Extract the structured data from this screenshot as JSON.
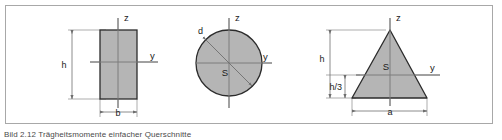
{
  "figure": {
    "caption": "Bild 2.12 Trägheitsmomente einfacher Querschnitte",
    "frame_color": "#a8a8a8",
    "fill_color": "#b5b5b5",
    "outline_color": "#2b2b2b",
    "axis_color": "#8a8a8a",
    "dim_color": "#6e6e6e",
    "background": "#ffffff"
  },
  "shapes": [
    {
      "id": "rectangle",
      "name": "rectangle-cross-section",
      "axis_z": "z",
      "axis_y": "y",
      "dims": [
        {
          "key": "height",
          "label": "h"
        },
        {
          "key": "width",
          "label": "b"
        }
      ]
    },
    {
      "id": "circle",
      "name": "circle-cross-section",
      "axis_z": "z",
      "axis_y": "y",
      "centroid": "S",
      "dims": [
        {
          "key": "diameter",
          "label": "d"
        }
      ]
    },
    {
      "id": "triangle",
      "name": "triangle-cross-section",
      "axis_z": "z",
      "axis_y": "y",
      "centroid": "S",
      "dims": [
        {
          "key": "height",
          "label": "h"
        },
        {
          "key": "centroid_height",
          "label": "h/3"
        },
        {
          "key": "base",
          "label": "a"
        }
      ]
    }
  ],
  "labels": {
    "rect_z": "z",
    "rect_y": "y",
    "rect_h": "h",
    "rect_b": "b",
    "circle_z": "z",
    "circle_y": "y",
    "circle_d": "d",
    "circle_s": "S",
    "tri_z": "z",
    "tri_y": "y",
    "tri_h": "h",
    "tri_h3": "h/3",
    "tri_a": "a",
    "tri_s": "S"
  }
}
